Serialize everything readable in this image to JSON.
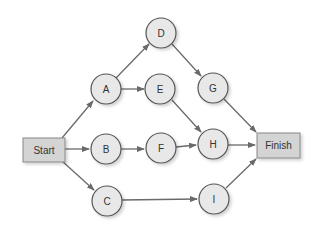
{
  "diagram": {
    "type": "network-diagram",
    "colors": {
      "node_fill": "#e8e8e8",
      "node_stroke": "#555555",
      "box_fill": "#d4d4d4",
      "box_stroke": "#888888",
      "edge": "#6a6a6a",
      "text": "#333333"
    },
    "start": {
      "id": "start",
      "label": "Start"
    },
    "finish": {
      "id": "finish",
      "label": "Finish"
    },
    "nodes": [
      {
        "id": "A",
        "label": "A"
      },
      {
        "id": "B",
        "label": "B"
      },
      {
        "id": "C",
        "label": "C"
      },
      {
        "id": "D",
        "label": "D"
      },
      {
        "id": "E",
        "label": "E"
      },
      {
        "id": "F",
        "label": "F"
      },
      {
        "id": "G",
        "label": "G"
      },
      {
        "id": "H",
        "label": "H"
      },
      {
        "id": "I",
        "label": "I"
      }
    ],
    "edges": [
      {
        "from": "Start",
        "to": "A"
      },
      {
        "from": "Start",
        "to": "B"
      },
      {
        "from": "Start",
        "to": "C"
      },
      {
        "from": "A",
        "to": "D"
      },
      {
        "from": "A",
        "to": "E"
      },
      {
        "from": "D",
        "to": "G"
      },
      {
        "from": "E",
        "to": "H"
      },
      {
        "from": "B",
        "to": "F"
      },
      {
        "from": "F",
        "to": "H"
      },
      {
        "from": "C",
        "to": "I"
      },
      {
        "from": "G",
        "to": "Finish"
      },
      {
        "from": "H",
        "to": "Finish"
      },
      {
        "from": "I",
        "to": "Finish"
      }
    ]
  }
}
